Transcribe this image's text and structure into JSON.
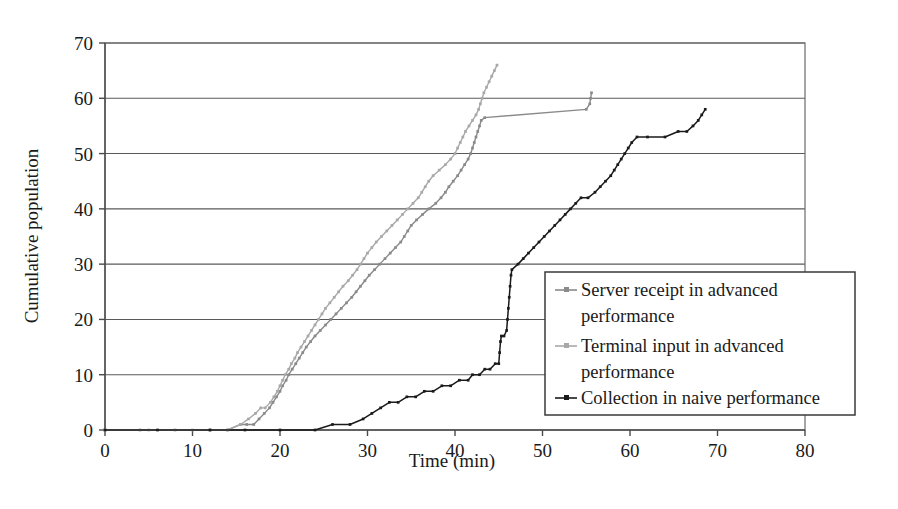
{
  "chart_data": {
    "type": "line",
    "title": "",
    "xlabel": "Time (min)",
    "ylabel": "Cumulative population",
    "xlim": [
      0,
      80
    ],
    "ylim": [
      0,
      70
    ],
    "xticks": [
      0,
      10,
      20,
      30,
      40,
      50,
      60,
      70,
      80
    ],
    "yticks": [
      0,
      10,
      20,
      30,
      40,
      50,
      60,
      70
    ],
    "grid": "horizontal",
    "legend_position": "lower-right-inside",
    "series": [
      {
        "name": "Server receipt in advanced performance",
        "color": "#8a8a8a",
        "marker": "small-square",
        "points": [
          [
            0,
            0
          ],
          [
            4,
            0
          ],
          [
            8,
            0
          ],
          [
            12,
            0
          ],
          [
            14,
            0
          ],
          [
            15.5,
            1
          ],
          [
            16.2,
            1
          ],
          [
            17.0,
            1
          ],
          [
            17.6,
            2
          ],
          [
            18.2,
            3
          ],
          [
            18.8,
            4
          ],
          [
            19.2,
            5
          ],
          [
            19.6,
            6
          ],
          [
            20.0,
            7
          ],
          [
            20.3,
            8
          ],
          [
            20.7,
            9
          ],
          [
            21.0,
            10
          ],
          [
            21.4,
            11
          ],
          [
            21.8,
            12
          ],
          [
            22.2,
            13
          ],
          [
            22.6,
            14
          ],
          [
            23.0,
            15
          ],
          [
            23.5,
            16
          ],
          [
            24.0,
            17
          ],
          [
            24.6,
            18
          ],
          [
            25.2,
            19
          ],
          [
            25.8,
            20
          ],
          [
            26.4,
            21
          ],
          [
            27.0,
            22
          ],
          [
            27.6,
            23
          ],
          [
            28.2,
            24
          ],
          [
            28.7,
            25
          ],
          [
            29.2,
            26
          ],
          [
            29.7,
            27
          ],
          [
            30.2,
            28
          ],
          [
            30.8,
            29
          ],
          [
            31.4,
            30
          ],
          [
            32.0,
            31
          ],
          [
            32.6,
            32
          ],
          [
            33.2,
            33
          ],
          [
            33.8,
            34
          ],
          [
            34.2,
            35
          ],
          [
            34.6,
            36
          ],
          [
            35.0,
            37
          ],
          [
            35.6,
            38
          ],
          [
            36.3,
            39
          ],
          [
            37.0,
            40
          ],
          [
            37.8,
            41
          ],
          [
            38.4,
            42
          ],
          [
            38.9,
            43
          ],
          [
            39.3,
            44
          ],
          [
            39.8,
            45
          ],
          [
            40.3,
            46
          ],
          [
            40.7,
            47
          ],
          [
            41.1,
            48
          ],
          [
            41.5,
            49
          ],
          [
            41.8,
            50
          ],
          [
            42.0,
            51
          ],
          [
            42.2,
            52
          ],
          [
            42.4,
            53
          ],
          [
            42.6,
            54
          ],
          [
            42.8,
            55
          ],
          [
            43.0,
            56
          ],
          [
            43.4,
            56.5
          ],
          [
            55.0,
            58
          ],
          [
            55.4,
            59
          ],
          [
            55.5,
            60
          ],
          [
            55.6,
            61
          ]
        ]
      },
      {
        "name": "Terminal input in advanced performance",
        "color": "#a8a8a8",
        "marker": "small-square",
        "points": [
          [
            0,
            0
          ],
          [
            5,
            0
          ],
          [
            10,
            0
          ],
          [
            14,
            0
          ],
          [
            15.5,
            1
          ],
          [
            16.4,
            2
          ],
          [
            17.2,
            3
          ],
          [
            17.8,
            4
          ],
          [
            18.3,
            4
          ],
          [
            18.9,
            5
          ],
          [
            19.3,
            6
          ],
          [
            19.7,
            7
          ],
          [
            20.0,
            8
          ],
          [
            20.3,
            9
          ],
          [
            20.6,
            10
          ],
          [
            21.0,
            11
          ],
          [
            21.3,
            12
          ],
          [
            21.7,
            13
          ],
          [
            22.0,
            14
          ],
          [
            22.4,
            15
          ],
          [
            22.8,
            16
          ],
          [
            23.2,
            17
          ],
          [
            23.6,
            18
          ],
          [
            24.0,
            19
          ],
          [
            24.4,
            20
          ],
          [
            24.8,
            21
          ],
          [
            25.2,
            22
          ],
          [
            25.7,
            23
          ],
          [
            26.2,
            24
          ],
          [
            26.7,
            25
          ],
          [
            27.2,
            26
          ],
          [
            27.8,
            27
          ],
          [
            28.3,
            28
          ],
          [
            28.8,
            29
          ],
          [
            29.2,
            30
          ],
          [
            29.6,
            31
          ],
          [
            30.0,
            32
          ],
          [
            30.5,
            33
          ],
          [
            31.0,
            34
          ],
          [
            31.6,
            35
          ],
          [
            32.2,
            36
          ],
          [
            32.8,
            37
          ],
          [
            33.4,
            38
          ],
          [
            34.0,
            39
          ],
          [
            34.6,
            40
          ],
          [
            35.2,
            41
          ],
          [
            35.8,
            42
          ],
          [
            36.2,
            43
          ],
          [
            36.6,
            44
          ],
          [
            37.0,
            45
          ],
          [
            37.5,
            46
          ],
          [
            38.2,
            47
          ],
          [
            38.9,
            48
          ],
          [
            39.5,
            49
          ],
          [
            40.0,
            50
          ],
          [
            40.3,
            51
          ],
          [
            40.6,
            52
          ],
          [
            40.9,
            53
          ],
          [
            41.2,
            54
          ],
          [
            41.6,
            55
          ],
          [
            42.0,
            56
          ],
          [
            42.4,
            57
          ],
          [
            42.7,
            58
          ],
          [
            42.9,
            59
          ],
          [
            43.1,
            60
          ],
          [
            43.3,
            61
          ],
          [
            43.6,
            62
          ],
          [
            43.9,
            63
          ],
          [
            44.2,
            64
          ],
          [
            44.5,
            65
          ],
          [
            44.8,
            66
          ]
        ]
      },
      {
        "name": "Collection in naive performance",
        "color": "#1a1a1a",
        "marker": "small-diamond",
        "points": [
          [
            0,
            0
          ],
          [
            6,
            0
          ],
          [
            12,
            0
          ],
          [
            16,
            0
          ],
          [
            20,
            0
          ],
          [
            24,
            0
          ],
          [
            26,
            1
          ],
          [
            28,
            1
          ],
          [
            29.5,
            2
          ],
          [
            30.5,
            3
          ],
          [
            31.5,
            4
          ],
          [
            32.5,
            5
          ],
          [
            33.5,
            5
          ],
          [
            34.5,
            6
          ],
          [
            35.5,
            6
          ],
          [
            36.5,
            7
          ],
          [
            37.5,
            7
          ],
          [
            38.5,
            8
          ],
          [
            39.5,
            8
          ],
          [
            40.5,
            9
          ],
          [
            41.5,
            9
          ],
          [
            42.0,
            10
          ],
          [
            42.8,
            10
          ],
          [
            43.4,
            11
          ],
          [
            44.0,
            11
          ],
          [
            44.6,
            12
          ],
          [
            45.0,
            12
          ],
          [
            45.1,
            14
          ],
          [
            45.2,
            16
          ],
          [
            45.3,
            17
          ],
          [
            45.6,
            17
          ],
          [
            45.9,
            18
          ],
          [
            46.0,
            20
          ],
          [
            46.1,
            22
          ],
          [
            46.2,
            24
          ],
          [
            46.3,
            26
          ],
          [
            46.4,
            28
          ],
          [
            46.5,
            29
          ],
          [
            47.2,
            30
          ],
          [
            47.8,
            31
          ],
          [
            48.4,
            32
          ],
          [
            49.0,
            33
          ],
          [
            49.6,
            34
          ],
          [
            50.2,
            35
          ],
          [
            50.8,
            36
          ],
          [
            51.4,
            37
          ],
          [
            52.0,
            38
          ],
          [
            52.6,
            39
          ],
          [
            53.2,
            40
          ],
          [
            53.8,
            41
          ],
          [
            54.4,
            42
          ],
          [
            55.2,
            42
          ],
          [
            56.0,
            43
          ],
          [
            56.6,
            44
          ],
          [
            57.2,
            45
          ],
          [
            57.8,
            46
          ],
          [
            58.2,
            47
          ],
          [
            58.6,
            48
          ],
          [
            59.0,
            49
          ],
          [
            59.4,
            50
          ],
          [
            59.8,
            51
          ],
          [
            60.2,
            52
          ],
          [
            60.8,
            53
          ],
          [
            62.0,
            53
          ],
          [
            64.0,
            53
          ],
          [
            65.5,
            54
          ],
          [
            66.5,
            54
          ],
          [
            67.2,
            55
          ],
          [
            67.8,
            56
          ],
          [
            68.2,
            57
          ],
          [
            68.6,
            58
          ]
        ]
      }
    ]
  },
  "legend": {
    "entries": [
      {
        "label_line1": "Server receipt in advanced",
        "label_line2": "performance"
      },
      {
        "label_line1": "Terminal input in advanced",
        "label_line2": "performance"
      },
      {
        "label_line1": "Collection in naive performance",
        "label_line2": ""
      }
    ]
  }
}
